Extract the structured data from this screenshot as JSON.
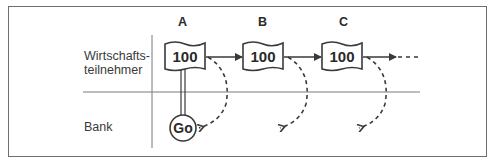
{
  "rows": {
    "participants": "Wirtschafts-\nteilnehmer",
    "participants_line1": "Wirtschafts-",
    "participants_line2": "teilnehmer",
    "bank": "Bank"
  },
  "columns": [
    {
      "label": "A",
      "amount": "100"
    },
    {
      "label": "B",
      "amount": "100"
    },
    {
      "label": "C",
      "amount": "100"
    }
  ],
  "bank_node": {
    "label": "Go"
  },
  "colors": {
    "line": "#3a3a3a",
    "divider": "#7a7a7a",
    "background": "#ffffff"
  }
}
